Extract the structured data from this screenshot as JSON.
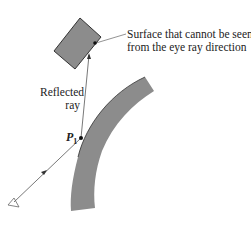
{
  "diagram": {
    "callout_label_line1": "Surface that cannot be seen",
    "callout_label_line2": "from the eye ray direction",
    "reflected_label_line1": "Reflected",
    "reflected_label_line2": "ray",
    "point_label": "P",
    "point_subscript": "1",
    "colors": {
      "surface_fill": "#8c8c8c",
      "outline": "#333333",
      "line": "#555555"
    },
    "elements": [
      "occluded-box",
      "curved-reflective-surface",
      "eye-ray",
      "reflected-ray",
      "eye-icon",
      "point-P1"
    ]
  }
}
